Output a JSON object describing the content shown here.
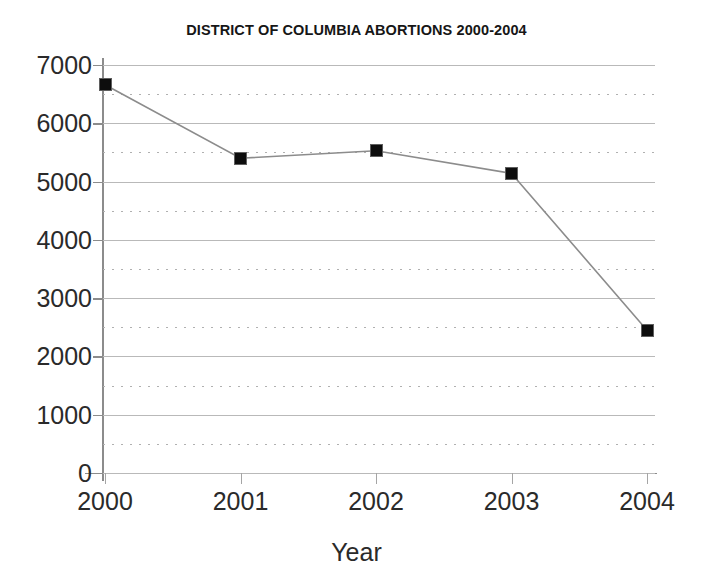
{
  "chart_data": {
    "type": "line",
    "title": "DISTRICT OF COLUMBIA ABORTIONS 2000-2004",
    "xlabel": "Year",
    "ylabel": "",
    "categories": [
      "2000",
      "2001",
      "2002",
      "2003",
      "2004"
    ],
    "values": [
      6660,
      5400,
      5530,
      5140,
      2450
    ],
    "series": [
      {
        "name": "Abortions",
        "values": [
          6660,
          5400,
          5530,
          5140,
          2450
        ]
      }
    ],
    "ylim": [
      0,
      7000
    ],
    "ytick_labels": [
      "0",
      "1000",
      "2000",
      "3000",
      "4000",
      "5000",
      "6000",
      "7000"
    ],
    "ytick_values": [
      0,
      1000,
      2000,
      3000,
      4000,
      5000,
      6000,
      7000
    ],
    "yminor_values": [
      500,
      1500,
      2500,
      3500,
      4500,
      5500,
      6500
    ],
    "xtick_labels": [
      "2000",
      "2001",
      "2002",
      "2003",
      "2004"
    ],
    "grid": "horizontal major solid and minor dotted",
    "legend": "none",
    "marker_style": "filled-square",
    "line_color": "#8c8c8c",
    "marker_color": "#0d0d0d",
    "grid_color": "#b9b9b9",
    "axis_color": "#8c8c8c",
    "background_color": "#ffffff"
  }
}
